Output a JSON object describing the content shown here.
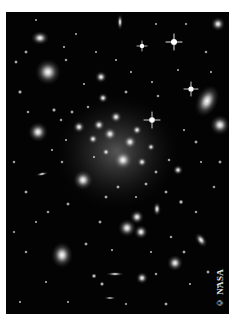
{
  "figure": {
    "credit": "© NASA",
    "background_color": "#030303",
    "page_background": "#ffffff"
  },
  "objects": {
    "cluster_core": {
      "cx": 117,
      "cy": 148,
      "r": 55
    },
    "bright_stars": [
      {
        "x": 174,
        "y": 42
      },
      {
        "x": 142,
        "y": 46
      },
      {
        "x": 191,
        "y": 89
      },
      {
        "x": 152,
        "y": 120
      }
    ],
    "large_galaxies": [
      {
        "x": 48,
        "y": 72,
        "r": 13
      },
      {
        "x": 34,
        "y": 38,
        "r": 8
      },
      {
        "x": 207,
        "y": 101,
        "rx": 11,
        "ry": 17
      },
      {
        "x": 220,
        "y": 125,
        "r": 10
      },
      {
        "x": 38,
        "y": 132,
        "r": 10
      },
      {
        "x": 83,
        "y": 180,
        "r": 10
      },
      {
        "x": 62,
        "y": 255,
        "rx": 11,
        "ry": 13
      },
      {
        "x": 127,
        "y": 228,
        "r": 9
      },
      {
        "x": 137,
        "y": 217,
        "r": 7
      },
      {
        "x": 141,
        "y": 232,
        "r": 7
      },
      {
        "x": 175,
        "y": 263,
        "r": 8
      }
    ]
  }
}
